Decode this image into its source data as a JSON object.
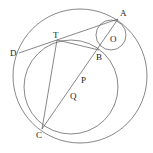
{
  "diagram": {
    "type": "geometry",
    "points": {
      "A": {
        "label": "A",
        "x": 118,
        "y": 19
      },
      "O": {
        "label": "O",
        "x": 112,
        "y": 38
      },
      "B": {
        "label": "B",
        "x": 99,
        "y": 50
      },
      "T": {
        "label": "T",
        "x": 57,
        "y": 40
      },
      "D": {
        "label": "D",
        "x": 19,
        "y": 53
      },
      "C": {
        "label": "C",
        "x": 42,
        "y": 129
      },
      "P": {
        "label": "P",
        "x": 83,
        "y": 80
      },
      "Q": {
        "label": "Q",
        "x": 73,
        "y": 96
      }
    },
    "circles": [
      {
        "name": "outer",
        "cx": 80,
        "cy": 76,
        "r": 67
      },
      {
        "name": "small-O",
        "cx": 111,
        "cy": 35,
        "r": 15
      },
      {
        "name": "inner",
        "cx": 71,
        "cy": 87,
        "r": 47
      }
    ],
    "segments": [
      [
        "D",
        "A"
      ],
      [
        "T",
        "B"
      ],
      [
        "A",
        "C"
      ],
      [
        "T",
        "C"
      ]
    ],
    "stroke_color": "#555555"
  }
}
